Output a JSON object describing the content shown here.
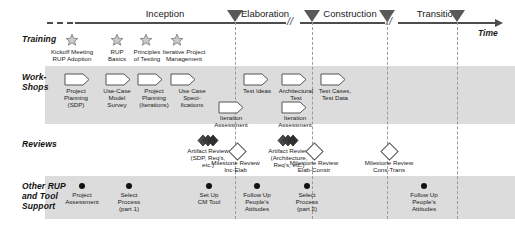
{
  "diagram": {
    "time_axis_label": "Time",
    "phases": [
      {
        "name": "Inception"
      },
      {
        "name": "Elaboration"
      },
      {
        "name": "Construction"
      },
      {
        "name": "Transition"
      }
    ],
    "rows": [
      {
        "id": "training",
        "label": "Training"
      },
      {
        "id": "workshops",
        "label": "Work-\nShops"
      },
      {
        "id": "reviews",
        "label": "Reviews"
      },
      {
        "id": "other",
        "label": "Other RUP\nand Tool\nSupport"
      }
    ],
    "training_items": [
      {
        "label": "Kickoff Meeting\nRUP Adoption"
      },
      {
        "label": "RUP\nBasics"
      },
      {
        "label": "Principles\nof Testing"
      },
      {
        "label": "Iterative Project\nManagement"
      }
    ],
    "workshop_items": [
      {
        "label": "Project\nPlanning\n(SDP)"
      },
      {
        "label": "Use-Case\nModel\nSurvey"
      },
      {
        "label": "Project\nPlanning\n(Iterations)"
      },
      {
        "label": "Use Case\nSpeci-\nfications"
      },
      {
        "label": "Test Ideas"
      },
      {
        "label": "Architectural\nTest"
      },
      {
        "label": "Test Cases,\nTest Data"
      }
    ],
    "workshop_items_lower": [
      {
        "label": "Iteration\nAssessment"
      },
      {
        "label": "Iteration\nAssessment"
      }
    ],
    "review_items": [
      {
        "type": "artifact",
        "label": "Artifact Review\n(SDP, Req's,\netc.)"
      },
      {
        "type": "milestone",
        "label": "Milestone Review\nInc-Elab"
      },
      {
        "type": "artifact",
        "label": "Artifact Review\n(Architecture,\nReq's, etc.)"
      },
      {
        "type": "milestone",
        "label": "Milestone Review\nElab-Constr"
      },
      {
        "type": "milestone",
        "label": "Milestone Review\nCons-Trans"
      }
    ],
    "support_items": [
      {
        "label": "Project\nAssessment"
      },
      {
        "label": "Select\nProcess\n(part 1)"
      },
      {
        "label": "Set Up\nCM Tool"
      },
      {
        "label": "Follow Up\nPeople's\nAttitudes"
      },
      {
        "label": "Select\nProcess\n(part 2)"
      },
      {
        "label": "Follow Up\nPeople's\nAttitudes"
      }
    ],
    "colors": {
      "band": "#dcdcdc",
      "axis": "#4d4d4d",
      "marker": "#595959",
      "dashed_guide": "#9a9a9a",
      "text": "#1a1a1a"
    }
  }
}
